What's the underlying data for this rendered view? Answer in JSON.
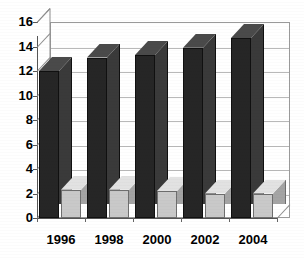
{
  "chart_data": {
    "type": "bar",
    "title": "",
    "subtitle": "",
    "xlabel": "",
    "ylabel": "",
    "categories": [
      "1996",
      "1998",
      "2000",
      "2002",
      "2004"
    ],
    "series": [
      {
        "name": "series-1",
        "color": "#262626",
        "values": [
          12.0,
          13.1,
          13.3,
          13.9,
          14.7
        ]
      },
      {
        "name": "series-2",
        "color": "#c9c9c9",
        "values": [
          2.3,
          2.3,
          2.2,
          2.0,
          2.0
        ]
      }
    ],
    "ylim": [
      0,
      16
    ],
    "ytick_step": 2,
    "ytick_labels": [
      "0",
      "2",
      "4",
      "6",
      "8",
      "10",
      "12",
      "14",
      "16"
    ],
    "xtick_labels": [
      "1996",
      "1998",
      "2000",
      "2002",
      "2004"
    ],
    "grid": true,
    "grid_axis": "y",
    "legend": false,
    "legend_position": "none",
    "style": "3d-column",
    "background": "#ffffff",
    "grid_color": "#b9b9b9",
    "axis_color": "#555555"
  }
}
